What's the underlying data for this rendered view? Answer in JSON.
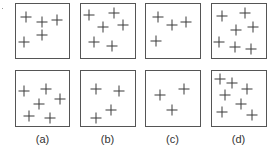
{
  "figure": {
    "columns": [
      {
        "label": "(a)",
        "x": 15
      },
      {
        "label": "(b)",
        "x": 80
      },
      {
        "label": "(c)",
        "x": 145
      },
      {
        "label": "(d)",
        "x": 211
      }
    ],
    "panels": [
      {
        "id": "a-top",
        "x": 15,
        "y": 3,
        "w": 55,
        "h": 56,
        "crosses": [
          [
            26,
            17
          ],
          [
            42,
            22
          ],
          [
            57,
            20
          ],
          [
            42,
            35
          ],
          [
            24,
            42
          ]
        ]
      },
      {
        "id": "b-top",
        "x": 80,
        "y": 3,
        "w": 56,
        "h": 56,
        "crosses": [
          [
            89,
            15
          ],
          [
            114,
            13
          ],
          [
            103,
            27
          ],
          [
            123,
            25
          ],
          [
            94,
            42
          ],
          [
            112,
            46
          ]
        ]
      },
      {
        "id": "c-top",
        "x": 145,
        "y": 3,
        "w": 56,
        "h": 56,
        "crosses": [
          [
            158,
            17
          ],
          [
            172,
            25
          ],
          [
            186,
            22
          ],
          [
            156,
            41
          ]
        ]
      },
      {
        "id": "d-top",
        "x": 211,
        "y": 3,
        "w": 56,
        "h": 56,
        "crosses": [
          [
            222,
            16
          ],
          [
            245,
            13
          ],
          [
            236,
            30
          ],
          [
            253,
            27
          ],
          [
            219,
            42
          ],
          [
            235,
            47
          ],
          [
            251,
            49
          ]
        ]
      },
      {
        "id": "a-bottom",
        "x": 15,
        "y": 70,
        "w": 55,
        "h": 57,
        "crosses": [
          [
            24,
            91
          ],
          [
            46,
            89
          ],
          [
            39,
            104
          ],
          [
            60,
            99
          ],
          [
            29,
            116
          ],
          [
            50,
            118
          ]
        ]
      },
      {
        "id": "b-bottom",
        "x": 80,
        "y": 70,
        "w": 56,
        "h": 57,
        "crosses": [
          [
            96,
            89
          ],
          [
            119,
            91
          ],
          [
            96,
            118
          ],
          [
            111,
            110
          ]
        ]
      },
      {
        "id": "c-bottom",
        "x": 145,
        "y": 70,
        "w": 56,
        "h": 57,
        "crosses": [
          [
            160,
            95
          ],
          [
            184,
            89
          ],
          [
            172,
            110
          ]
        ]
      },
      {
        "id": "d-bottom",
        "x": 211,
        "y": 70,
        "w": 56,
        "h": 57,
        "crosses": [
          [
            220,
            79
          ],
          [
            232,
            83
          ],
          [
            247,
            89
          ],
          [
            225,
            95
          ],
          [
            241,
            104
          ],
          [
            222,
            112
          ],
          [
            252,
            115
          ]
        ]
      }
    ],
    "colors": {
      "border": "#555555",
      "cross": "#3a3a3a",
      "label": "#333333"
    }
  }
}
